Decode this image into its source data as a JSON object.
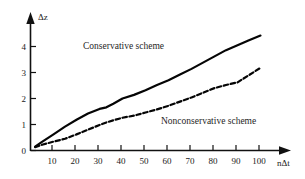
{
  "chart_data": {
    "type": "line",
    "title": "",
    "subtitle": "",
    "xlabel": "nΔt",
    "ylabel": "Δz",
    "xlim": [
      0,
      105
    ],
    "ylim": [
      0,
      4.8
    ],
    "grid": false,
    "legend_position": "inline-annotation",
    "xticks": [
      10,
      20,
      30,
      40,
      50,
      60,
      70,
      80,
      90,
      100
    ],
    "xtick_labels": [
      "10",
      "20",
      "30",
      "40",
      "50",
      "60",
      "70",
      "80",
      "90",
      "100"
    ],
    "yticks": [
      0,
      1,
      2,
      3,
      4
    ],
    "ytick_labels": [
      "0",
      "1",
      "2",
      "3",
      "4"
    ],
    "x": [
      2,
      5,
      10,
      15,
      20,
      25,
      30,
      33,
      36,
      40,
      45,
      50,
      55,
      60,
      65,
      70,
      75,
      80,
      85,
      90,
      95,
      100
    ],
    "series": [
      {
        "name": "Conservative scheme",
        "style": "solid",
        "color": "#050505",
        "values": [
          0.15,
          0.33,
          0.62,
          0.92,
          1.18,
          1.42,
          1.6,
          1.66,
          1.8,
          2.0,
          2.14,
          2.32,
          2.52,
          2.7,
          2.92,
          3.14,
          3.38,
          3.62,
          3.86,
          4.05,
          4.24,
          4.42
        ],
        "label_text": "Conservative scheme",
        "end_value": 4.42
      },
      {
        "name": "Nonconservative scheme",
        "style": "dashed",
        "color": "#050505",
        "values": [
          0.13,
          0.22,
          0.34,
          0.45,
          0.62,
          0.8,
          0.98,
          1.08,
          1.16,
          1.26,
          1.34,
          1.46,
          1.58,
          1.72,
          1.88,
          2.04,
          2.22,
          2.4,
          2.52,
          2.62,
          2.9,
          3.18
        ],
        "label_text": "Nonconservative scheme",
        "end_value": 3.18
      }
    ],
    "annotations": [
      {
        "text": "Conservative scheme",
        "x": 22,
        "y": 3.85
      },
      {
        "text": "Nonconservative scheme",
        "x": 55,
        "y": 1.18
      }
    ]
  },
  "axes": {
    "y_axis_name": "Δz",
    "x_axis_name": "nΔt"
  }
}
